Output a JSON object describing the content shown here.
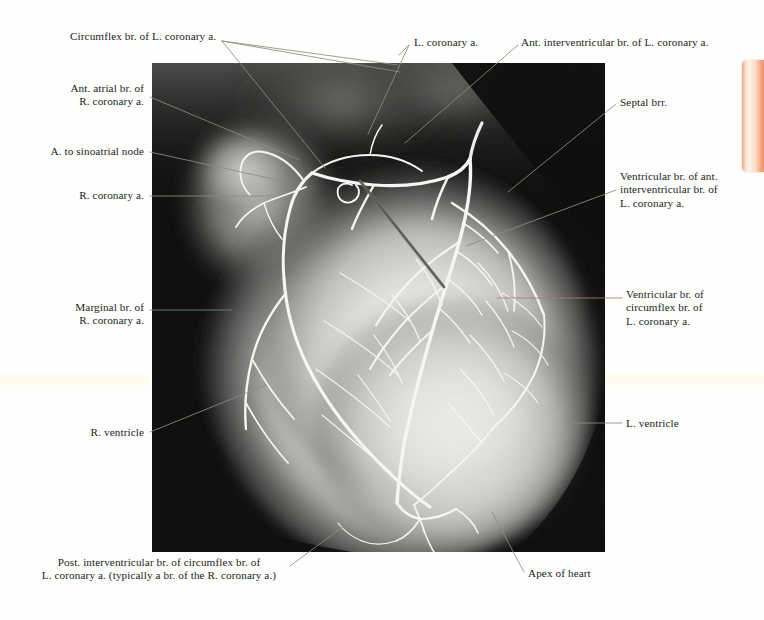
{
  "plate": {
    "type": "coronary-arteriogram",
    "modality": "x-ray angiogram",
    "subject": "heart, anterior view"
  },
  "labels": [
    {
      "id": "circumflex",
      "name": "label-circumflex-branch",
      "text": "Circumflex br. of L. coronary a.",
      "align": "left",
      "x": 70,
      "y": 30,
      "width": 210
    },
    {
      "id": "l-coronary",
      "name": "label-left-coronary-artery",
      "text": "L. coronary a.",
      "align": "left",
      "x": 414,
      "y": 36,
      "width": 90
    },
    {
      "id": "ant-interventricular",
      "name": "label-ant-interventricular-branch",
      "text": "Ant. interventricular br. of L. coronary a.",
      "align": "left",
      "x": 521,
      "y": 36,
      "width": 240
    },
    {
      "id": "ant-atrial",
      "name": "label-ant-atrial-branch",
      "text": "Ant. atrial br. of\nR. coronary a.",
      "align": "right",
      "x": 20,
      "y": 82,
      "width": 124
    },
    {
      "id": "septal",
      "name": "label-septal-branches",
      "text": "Septal brr.",
      "align": "left",
      "x": 620,
      "y": 96,
      "width": 80
    },
    {
      "id": "sinoatrial",
      "name": "label-artery-to-sinoatrial-node",
      "text": "A. to sinoatrial node",
      "align": "right",
      "x": 18,
      "y": 144,
      "width": 126
    },
    {
      "id": "r-coronary",
      "name": "label-right-coronary-artery",
      "text": "R. coronary a.",
      "align": "right",
      "x": 46,
      "y": 189,
      "width": 98
    },
    {
      "id": "ventricular-ant-iv",
      "name": "label-ventricular-branch-of-ant-interventricular",
      "text": "Ventricular br. of ant.\ninterventricular br. of\nL. coronary a.",
      "align": "left",
      "x": 620,
      "y": 170,
      "width": 140
    },
    {
      "id": "ventricular-circumflex",
      "name": "label-ventricular-branch-of-circumflex",
      "text": "Ventricular br. of\ncircumflex br. of\nL. coronary a.",
      "align": "left",
      "x": 626,
      "y": 288,
      "width": 130
    },
    {
      "id": "marginal",
      "name": "label-marginal-branch",
      "text": "Marginal br. of\nR. coronary a.",
      "align": "right",
      "x": 30,
      "y": 301,
      "width": 114
    },
    {
      "id": "r-ventricle",
      "name": "label-right-ventricle",
      "text": "R. ventricle",
      "align": "right",
      "x": 62,
      "y": 428,
      "width": 82
    },
    {
      "id": "l-ventricle",
      "name": "label-left-ventricle",
      "text": "L. ventricle",
      "align": "left",
      "x": 626,
      "y": 416,
      "width": 84
    },
    {
      "id": "post-interventricular",
      "name": "label-post-interventricular-branch",
      "text": "Post. interventricular br. of circumflex br. of\nL. coronary a. (typically a br. of the R. coronary a.)",
      "align": "center",
      "x": 28,
      "y": 563,
      "width": 262
    },
    {
      "id": "apex",
      "name": "label-apex-of-heart",
      "text": "Apex of heart",
      "align": "left",
      "x": 528,
      "y": 568,
      "width": 96
    }
  ],
  "colors": {
    "page_background": "#fefefd",
    "label_text": "#211d1c",
    "leader_line": "#8e8b88",
    "plate_background": "#0b0a09",
    "tab_accent": "#ef8f62"
  }
}
